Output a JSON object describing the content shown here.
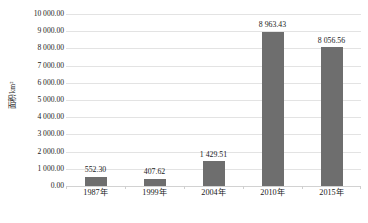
{
  "chart_data": {
    "type": "bar",
    "title": "",
    "subtitle": "",
    "xlabel": "",
    "ylabel": "面积/km²",
    "categories": [
      "1987年",
      "1999年",
      "2004年",
      "2010年",
      "2015年"
    ],
    "values": [
      552.3,
      407.62,
      1429.51,
      8963.43,
      8056.56
    ],
    "value_labels": [
      "552.30",
      "407.62",
      "1 429.51",
      "8 963.43",
      "8 056.56"
    ],
    "series": [
      {
        "name": "面积",
        "values": [
          552.3,
          407.62,
          1429.51,
          8963.43,
          8056.56
        ]
      }
    ],
    "ylim": [
      0,
      10000
    ],
    "ytick_step": 1000,
    "ytick_values": [
      0,
      1000,
      2000,
      3000,
      4000,
      5000,
      6000,
      7000,
      8000,
      9000,
      10000
    ],
    "ytick_labels": [
      "0.00",
      "1 000.00",
      "2 000.00",
      "3 000.00",
      "4 000.00",
      "5 000.00",
      "6 000.00",
      "7 000.00",
      "8 000.00",
      "9 000.00",
      "10 000.00"
    ],
    "grid": true,
    "grid_axis": "y",
    "legend": false,
    "legend_position": "none",
    "bar_color": "#6e6e6e",
    "gridline_color": "#e3e3e3",
    "background_color": "#ffffff",
    "text_color": "#1a1a1a",
    "data_labels_shown": true
  }
}
